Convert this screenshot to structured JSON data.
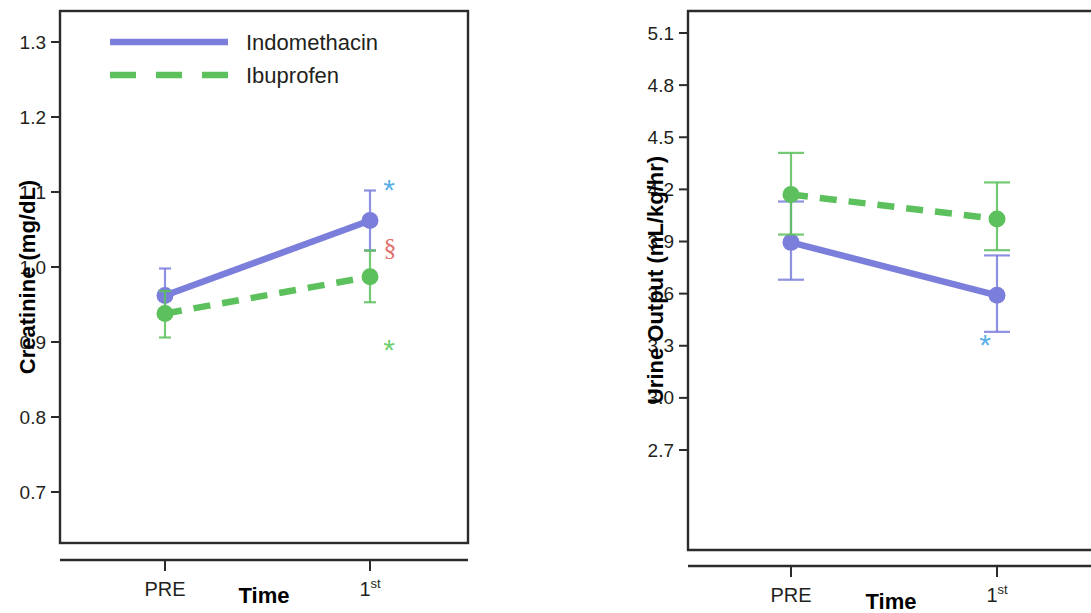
{
  "figure": {
    "panels": [
      {
        "id": "creatinine",
        "legend": {
          "position": "top-left-inside",
          "entries": [
            {
              "label": "Indomethacin",
              "color": "#7b7fdb",
              "style": "solid"
            },
            {
              "label": "Ibuprofen",
              "color": "#5cc15c",
              "style": "dashed"
            }
          ]
        },
        "annotations": [
          {
            "text": "*",
            "color": "#5aafe6",
            "series": "Indomethacin",
            "x": "1st"
          },
          {
            "text": "§",
            "color": "#e0736f",
            "series": "Indomethacin",
            "x": "1st"
          },
          {
            "text": "*",
            "color": "#6fd06f",
            "series": "Ibuprofen",
            "x": "1st"
          }
        ]
      },
      {
        "id": "urine-output",
        "legend": {
          "position": "none",
          "entries": []
        },
        "annotations": [
          {
            "text": "*",
            "color": "#5aafe6",
            "series": "Indomethacin",
            "x": "1st"
          }
        ]
      }
    ]
  },
  "chart_data": [
    {
      "type": "line",
      "id": "creatinine",
      "title": "",
      "xlabel": "Time",
      "ylabel": "Creatinine (mg/dL)",
      "categories": [
        "PRE",
        "1st"
      ],
      "category_labels_raw": [
        "PRE",
        "1st"
      ],
      "yticks": [
        0.7,
        0.8,
        0.9,
        1.0,
        1.1,
        1.2,
        1.3
      ],
      "ytick_labels": [
        "0.7",
        "0.8",
        "0.9",
        "1.0",
        "1.1",
        "1.2",
        "1.3"
      ],
      "ylim": [
        0.66,
        1.34
      ],
      "grid": false,
      "errorbars": "95% CI",
      "series": [
        {
          "name": "Indomethacin",
          "color": "#7b7fdb",
          "style": "solid",
          "marker": "circle",
          "values": [
            0.962,
            1.062
          ],
          "err_low": [
            0.932,
            1.022
          ],
          "err_high": [
            0.998,
            1.102
          ]
        },
        {
          "name": "Ibuprofen",
          "color": "#5cc15c",
          "style": "dashed",
          "marker": "circle",
          "values": [
            0.938,
            0.987
          ],
          "err_low": [
            0.906,
            0.953
          ],
          "err_high": [
            0.968,
            1.022
          ]
        }
      ]
    },
    {
      "type": "line",
      "id": "urine-output",
      "title": "",
      "xlabel": "Time",
      "ylabel": "Urine Output (mL/kg/hr)",
      "categories": [
        "PRE",
        "1st"
      ],
      "category_labels_raw": [
        "PRE",
        "1st"
      ],
      "yticks": [
        2.7,
        3.0,
        3.3,
        3.6,
        3.9,
        4.2,
        4.5,
        4.8,
        5.1
      ],
      "ytick_labels": [
        "2.7",
        "3.0",
        "3.3",
        "3.6",
        "3.9",
        "4.2",
        "4.5",
        "4.8",
        "5.1"
      ],
      "ylim": [
        2.58,
        5.19
      ],
      "grid": false,
      "errorbars": "95% CI",
      "series": [
        {
          "name": "Indomethacin",
          "color": "#7b7fdb",
          "style": "solid",
          "marker": "circle",
          "values": [
            3.895,
            3.59
          ],
          "err_low": [
            3.68,
            3.38
          ],
          "err_high": [
            4.13,
            3.82
          ]
        },
        {
          "name": "Ibuprofen",
          "color": "#5cc15c",
          "style": "dashed",
          "marker": "circle",
          "values": [
            4.17,
            4.03
          ],
          "err_low": [
            3.94,
            3.85
          ],
          "err_high": [
            4.41,
            4.24
          ]
        }
      ]
    }
  ]
}
